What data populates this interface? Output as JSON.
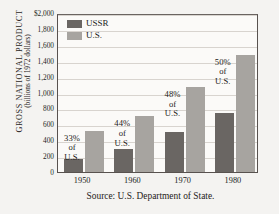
{
  "chart_data": {
    "type": "bar",
    "title": "",
    "xlabel": "",
    "ylabel": "GROSS NATIONAL PRODUCT (billions of 1972 dollars)",
    "ylabel_line1": "GROSS  NATIONAL  PRODUCT",
    "ylabel_line2": "(billions of 1972 dollars)",
    "categories": [
      "1950",
      "1960",
      "1970",
      "1980"
    ],
    "series": [
      {
        "name": "USSR",
        "values": [
          170,
          290,
          500,
          740
        ],
        "color": "#6a6663"
      },
      {
        "name": "U.S.",
        "values": [
          520,
          700,
          1070,
          1475
        ],
        "color": "#a7a4a0"
      }
    ],
    "ylim": [
      0,
      2000
    ],
    "ytick_values": [
      0,
      200,
      400,
      600,
      800,
      1000,
      1200,
      1400,
      1600,
      1800,
      2000
    ],
    "ytick_labels": [
      "0",
      "200",
      "400",
      "600",
      "800",
      "1,000",
      "1,200",
      "1,400",
      "1,600",
      "1,800",
      "$2,000"
    ],
    "grid": true,
    "legend_position": "top-left",
    "annotations": [
      {
        "category": "1950",
        "lines": [
          "33%",
          "of",
          "U.S."
        ]
      },
      {
        "category": "1960",
        "lines": [
          "44%",
          "of",
          "U.S."
        ]
      },
      {
        "category": "1970",
        "lines": [
          "48%",
          "of",
          "U.S."
        ]
      },
      {
        "category": "1980",
        "lines": [
          "50%",
          "of",
          "U.S."
        ]
      }
    ],
    "source": "Source: U.S. Department of State."
  },
  "legend": {
    "items": [
      {
        "label": "USSR",
        "color": "#6a6663"
      },
      {
        "label": "U.S.",
        "color": "#a7a4a0"
      }
    ]
  },
  "footer": {
    "source": "Source: U.S. Department of State."
  },
  "colors": {
    "ussr": "#6a6663",
    "us": "#a7a4a0",
    "axis": "#58524f",
    "grid": "#d8d4cf",
    "background": "#f4f3f1",
    "plot_background": "#fbfaf8",
    "text": "#211d1b"
  }
}
